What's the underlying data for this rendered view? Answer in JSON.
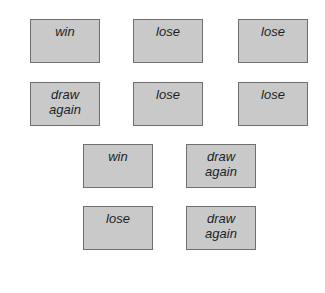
{
  "cards": [
    {
      "lines": [
        "win"
      ],
      "x": 30,
      "y": 19
    },
    {
      "lines": [
        "lose"
      ],
      "x": 133,
      "y": 19
    },
    {
      "lines": [
        "lose"
      ],
      "x": 238,
      "y": 19
    },
    {
      "lines": [
        "draw",
        "again"
      ],
      "x": 30,
      "y": 82
    },
    {
      "lines": [
        "lose"
      ],
      "x": 133,
      "y": 82
    },
    {
      "lines": [
        "lose"
      ],
      "x": 238,
      "y": 82
    },
    {
      "lines": [
        "win"
      ],
      "x": 83,
      "y": 144
    },
    {
      "lines": [
        "draw",
        "again"
      ],
      "x": 186,
      "y": 144
    },
    {
      "lines": [
        "lose"
      ],
      "x": 83,
      "y": 206
    },
    {
      "lines": [
        "draw",
        "again"
      ],
      "x": 186,
      "y": 206
    }
  ],
  "colors": {
    "card_fill": "#c9c9c9",
    "card_border": "#6f6f6f",
    "text": "#1e1e1e"
  }
}
